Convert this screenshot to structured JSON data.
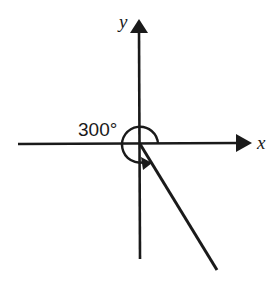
{
  "diagram": {
    "type": "angle-in-standard-position",
    "axes": {
      "x_label": "x",
      "y_label": "y"
    },
    "angle": {
      "label": "300°",
      "degrees": 300,
      "direction": "counterclockwise",
      "terminal_quadrant": "IV"
    },
    "colors": {
      "ink": "#1a1a1a",
      "background": "#ffffff"
    }
  }
}
